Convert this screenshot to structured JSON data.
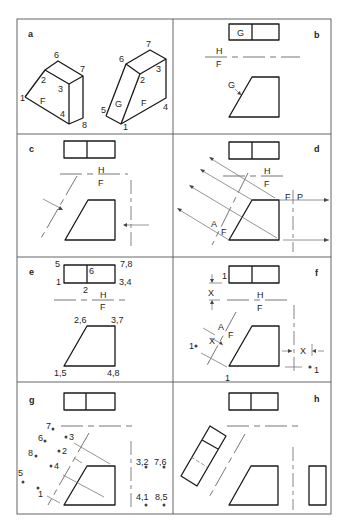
{
  "figure": {
    "colors": {
      "ink": "#1a1a1a",
      "construction": "#7a7a7a",
      "frame": "#555555",
      "background": "#ffffff"
    },
    "panels": [
      {
        "id": "a",
        "label": "a"
      },
      {
        "id": "b",
        "label": "b"
      },
      {
        "id": "c",
        "label": "c"
      },
      {
        "id": "d",
        "label": "d"
      },
      {
        "id": "e",
        "label": "e"
      },
      {
        "id": "f",
        "label": "f"
      },
      {
        "id": "g",
        "label": "g"
      },
      {
        "id": "h",
        "label": "h"
      }
    ],
    "panel_a": {
      "left_solid_vertices": [
        "1",
        "2",
        "3",
        "4",
        "6",
        "7",
        "8"
      ],
      "left_face_label": "F",
      "right_solid_vertices": [
        "1",
        "2",
        "3",
        "4",
        "5",
        "6",
        "7"
      ],
      "right_face_labels": [
        "G",
        "F"
      ]
    },
    "panel_b": {
      "top_view_face": "G",
      "fold_top": "H",
      "fold_bottom": "F",
      "arrow_label": "G"
    },
    "panel_c": {
      "fold_top": "H",
      "fold_bottom": "F"
    },
    "panel_d": {
      "fold_top": "H",
      "fold_bottom": "F",
      "aux_fold_left": "A",
      "aux_fold_right": "F",
      "profile_fold_left": "F",
      "profile_fold_right": "P"
    },
    "panel_e": {
      "top_labels": [
        "5",
        "6",
        "7,8",
        "1",
        "2",
        "3,4"
      ],
      "fold_top": "H",
      "fold_bottom": "F",
      "front_labels": [
        "2,6",
        "3,7",
        "1,5",
        "4,8"
      ]
    },
    "panel_f": {
      "dim_label": "X",
      "dim_one": "1",
      "fold_top": "H",
      "fold_bottom": "F",
      "aux_fold_left": "A",
      "aux_fold_right": "F",
      "aux_point": "1",
      "front_point": "1",
      "profile_point": "1"
    },
    "panel_g": {
      "aux_points": [
        "7",
        "6",
        "8",
        "5",
        "3",
        "2",
        "4",
        "1"
      ],
      "profile_points": [
        "3,2",
        "7,6",
        "4,1",
        "8,5"
      ]
    },
    "panel_h": {}
  }
}
